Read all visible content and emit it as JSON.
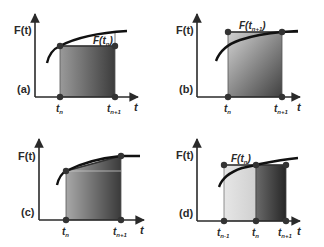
{
  "figure": {
    "panels": [
      {
        "id": "a",
        "panel_label": "(a)",
        "y_label": "F(t)",
        "x_label": "t",
        "ticks": [
          {
            "main": "t",
            "sub": "n"
          },
          {
            "main": "t",
            "sub": "n+1"
          }
        ],
        "annotation": {
          "main": "F(t",
          "sub": "n",
          "close": ")"
        },
        "description": "Left-endpoint rectangle: height F(t_n) over [t_n, t_n+1]"
      },
      {
        "id": "b",
        "panel_label": "(b)",
        "y_label": "F(t)",
        "x_label": "t",
        "ticks": [
          {
            "main": "t",
            "sub": "n"
          },
          {
            "main": "t",
            "sub": "n+1"
          }
        ],
        "annotation": {
          "main": "F(t",
          "sub": "n+1",
          "close": ")"
        },
        "description": "Right-endpoint rectangle: height F(t_n+1) over [t_n, t_n+1]"
      },
      {
        "id": "c",
        "panel_label": "(c)",
        "y_label": "F(t)",
        "x_label": "t",
        "ticks": [
          {
            "main": "t",
            "sub": "n"
          },
          {
            "main": "t",
            "sub": "n+1"
          }
        ],
        "description": "Trapezoid between F(t_n) and F(t_n+1)"
      },
      {
        "id": "d",
        "panel_label": "(d)",
        "y_label": "F(t)",
        "x_label": "t",
        "ticks": [
          {
            "main": "t",
            "sub": "n-1"
          },
          {
            "main": "t",
            "sub": "n"
          },
          {
            "main": "t",
            "sub": "n+1"
          }
        ],
        "annotation": {
          "main": "F(t",
          "sub": "n",
          "close": ")"
        },
        "description": "Midpoint-style rectangles of height F(t_n) spanning [t_n-1, t_n+1]"
      }
    ],
    "colors": {
      "axis": "#2a2a2a",
      "curve": "#111111",
      "point": "#333333",
      "fill_dark": "#3a3a3a",
      "fill_light": "#d0d0d0",
      "fill_pale": "#e4e4e4"
    }
  }
}
